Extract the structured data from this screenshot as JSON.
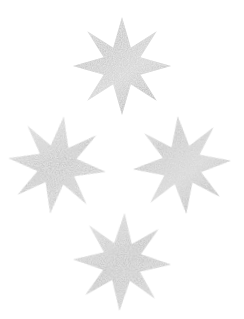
{
  "canvas": {
    "width": 244,
    "height": 319,
    "background_color": "#ffffff",
    "title": "Glitter Star Decorations"
  },
  "palette": {
    "background": "#ffffff",
    "star_light": "#e4e4e4",
    "star_mid": "#c9c9c9",
    "star_dark": "#ababab",
    "star_speckle": "#f7f7f7",
    "star_edge": "#bdbdbd"
  },
  "shape": {
    "name": "eight-pointed-star",
    "points": 8,
    "outer_radius": 50,
    "inner_radius": 17,
    "texture": "glitter-speckle",
    "rotation_offset_deg": 22.5
  },
  "stars": [
    {
      "id": "star-top",
      "label": "Top star",
      "center_x": 122,
      "center_y": 66,
      "size": 98,
      "rotation_deg": 0,
      "opacity": 0.95
    },
    {
      "id": "star-left",
      "label": "Left star",
      "center_x": 57,
      "center_y": 165,
      "size": 98,
      "rotation_deg": 8,
      "opacity": 0.95
    },
    {
      "id": "star-right",
      "label": "Right star",
      "center_x": 182,
      "center_y": 165,
      "size": 98,
      "rotation_deg": -5,
      "opacity": 0.95
    },
    {
      "id": "star-bottom",
      "label": "Bottom star",
      "center_x": 122,
      "center_y": 262,
      "size": 98,
      "rotation_deg": 3,
      "opacity": 0.95
    }
  ]
}
